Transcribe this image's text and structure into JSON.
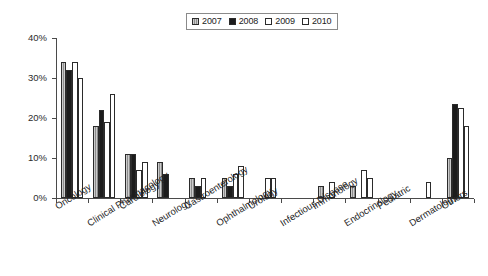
{
  "chart_data": {
    "type": "bar",
    "title": "",
    "subtitle": "",
    "xlabel": "",
    "ylabel": "",
    "ylim": [
      0,
      40
    ],
    "ytick_labels": [
      "0%",
      "10%",
      "20%",
      "30%",
      "40%"
    ],
    "ytick_values": [
      0,
      10,
      20,
      30,
      40
    ],
    "grid": false,
    "legend_position": "top-center",
    "value_unit": "%",
    "categories": [
      "Oncology",
      "Clinical Pharmacology",
      "Cardiology",
      "Neurology",
      "Gastroenterology",
      "Ophthalmology",
      "Urology",
      "Infectious Disease",
      "Immunology",
      "Endocrinology",
      "Pediatric",
      "Dermatology",
      "Others"
    ],
    "series": [
      {
        "name": "2007",
        "color": "#8d8d8d",
        "pattern": "vertical-hatch",
        "values": [
          34,
          18,
          11,
          9,
          5,
          5,
          0,
          0,
          3,
          3,
          0,
          0,
          10
        ]
      },
      {
        "name": "2008",
        "color": "#1c1c1c",
        "pattern": "solid",
        "values": [
          32,
          22,
          11,
          6,
          3,
          3,
          0,
          0,
          0,
          0,
          0,
          0,
          23.5
        ]
      },
      {
        "name": "2009",
        "color": "#ffffff",
        "pattern": "empty",
        "values": [
          34,
          19,
          7,
          0,
          5,
          6,
          5,
          0,
          4,
          7,
          0,
          4,
          22.5
        ]
      },
      {
        "name": "2010",
        "color": "#ffffff",
        "pattern": "empty",
        "values": [
          30,
          26,
          9,
          0,
          0,
          8,
          5,
          0,
          0,
          5,
          0,
          0,
          18
        ]
      }
    ]
  },
  "legend": {
    "entries": [
      {
        "label": "2007"
      },
      {
        "label": "2008"
      },
      {
        "label": "2009"
      },
      {
        "label": "2010"
      }
    ]
  }
}
